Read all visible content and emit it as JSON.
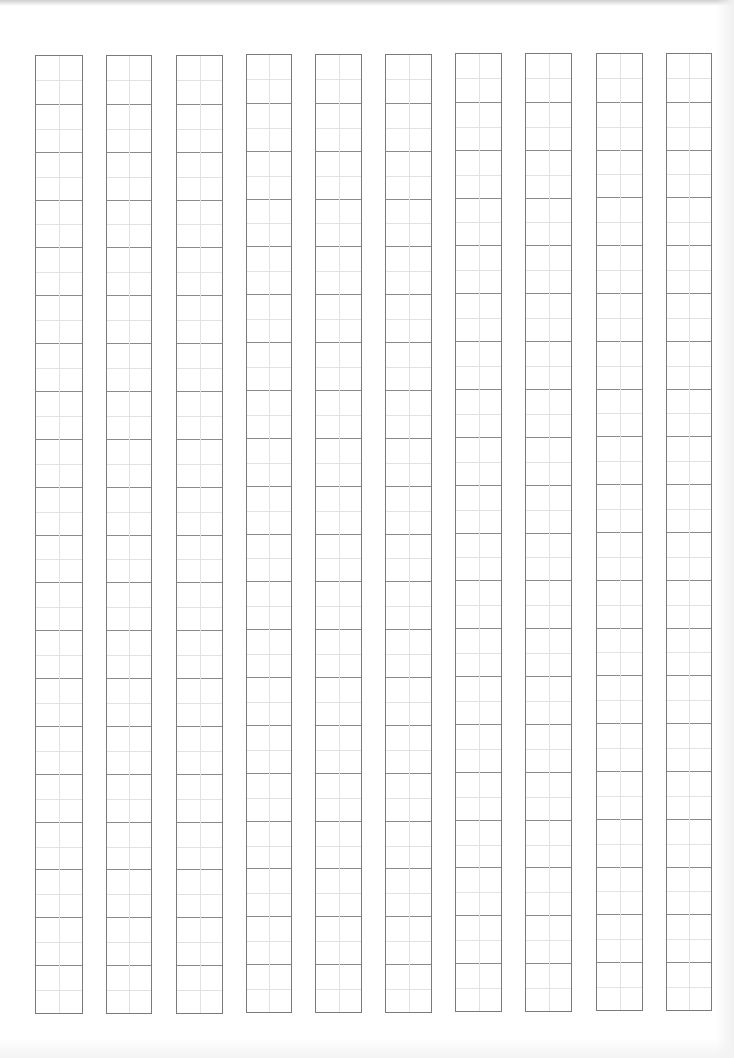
{
  "document": {
    "type": "calligraphy-practice-sheet",
    "title": "",
    "columns_count": 10,
    "rows_per_column": 20,
    "cell_style": "half-divided guide cells (vertical center line + horizontal mid line)",
    "columns": [
      {
        "left": 35,
        "right": 83,
        "top": 55,
        "bottom": 1014
      },
      {
        "left": 106,
        "right": 152,
        "top": 55,
        "bottom": 1014
      },
      {
        "left": 176,
        "right": 223,
        "top": 55,
        "bottom": 1014
      },
      {
        "left": 246,
        "right": 292,
        "top": 54,
        "bottom": 1013
      },
      {
        "left": 315,
        "right": 362,
        "top": 54,
        "bottom": 1013
      },
      {
        "left": 385,
        "right": 432,
        "top": 54,
        "bottom": 1013
      },
      {
        "left": 455,
        "right": 502,
        "top": 53,
        "bottom": 1012
      },
      {
        "left": 525,
        "right": 572,
        "top": 53,
        "bottom": 1012
      },
      {
        "left": 596,
        "right": 643,
        "top": 53,
        "bottom": 1011
      },
      {
        "left": 666,
        "right": 712,
        "top": 53,
        "bottom": 1011
      }
    ],
    "colors": {
      "paper": "#ffffff",
      "border": "#7a7a7a",
      "row_line": "#8a8a8a",
      "guide_line": "#e2e2e2"
    }
  }
}
